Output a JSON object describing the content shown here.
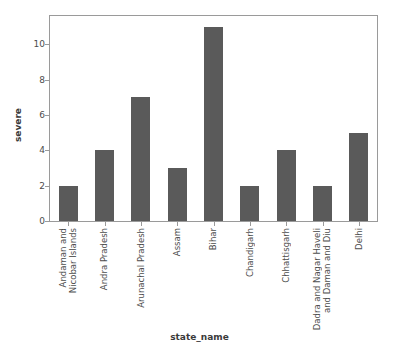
{
  "chart_data": {
    "type": "bar",
    "title": "",
    "subtitle": "",
    "xlabel": "state_name",
    "ylabel": "severe",
    "categories": [
      "Andaman and Nicobar Islands",
      "Andra Pradesh",
      "Arunachal Pradesh",
      "Assam",
      "Bihar",
      "Chandigarh",
      "Chhattisgarh",
      "Dadra and Nagar Haveli and Daman and Diu",
      "Delhi"
    ],
    "category_lines": [
      [
        "Andaman and",
        "Nicobar Islands"
      ],
      [
        "Andra Pradesh"
      ],
      [
        "Arunachal Pradesh"
      ],
      [
        "Assam"
      ],
      [
        "Bihar"
      ],
      [
        "Chandigarh"
      ],
      [
        "Chhattisgarh"
      ],
      [
        "Dadra and Nagar Haveli",
        "and Daman and Diu"
      ],
      [
        "Delhi"
      ]
    ],
    "values": [
      2,
      4,
      7,
      3,
      11,
      2,
      4,
      2,
      5
    ],
    "ylim": [
      0,
      11.6
    ],
    "yticks": [
      0,
      2,
      4,
      6,
      8,
      10
    ],
    "ytick_labels": [
      "0",
      "2",
      "4",
      "6",
      "8",
      "10"
    ],
    "grid": false,
    "legend": null,
    "bar_color": "#5a5a5a",
    "frame_color": "#9a9a9a",
    "text_color": "#4d4d4d",
    "background": "#ffffff"
  }
}
